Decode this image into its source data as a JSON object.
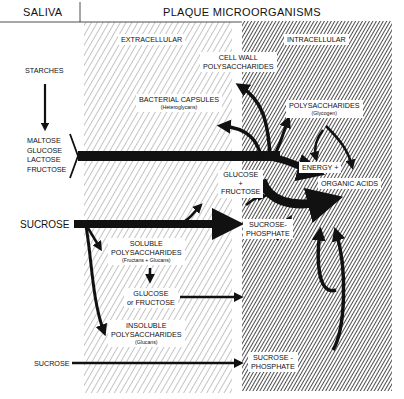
{
  "header": {
    "left_title": "SALIVA",
    "right_title": "PLAQUE MICROORGANISMS"
  },
  "regions": {
    "extracellular": "EXTRACELLULAR",
    "intracellular": "INTRACELLULAR"
  },
  "saliva": {
    "starches": "STARCHES",
    "sugars": [
      "MALTOSE",
      "GLUCOSE",
      "LACTOSE",
      "FRUCTOSE"
    ],
    "sucrose_main": "SUCROSE",
    "sucrose_lower": "SUCROSE"
  },
  "extracellular_nodes": {
    "cell_wall": [
      "CELL WALL",
      "POLYSACCHARIDES"
    ],
    "bacterial_capsules": "BACTERIAL CAPSULES",
    "bacterial_capsules_sub": "(Heteroglycans)",
    "glucose_fructose": [
      "GLUCOSE",
      "+",
      "FRUCTOSE"
    ],
    "soluble_poly": [
      "SOLUBLE",
      "POLYSACCHARIDES"
    ],
    "soluble_poly_sub": "(Fructans + Glucans)",
    "glucose_or_fructose": [
      "GLUCOSE",
      "or FRUCTOSE"
    ],
    "insoluble_poly": [
      "INSOLUBLE",
      "POLYSACCHARIDES"
    ],
    "insoluble_poly_sub": "(Glucans)"
  },
  "intracellular_nodes": {
    "polysaccharides": "POLYSACCHARIDES",
    "polysaccharides_sub": "(Glycogen)",
    "energy": "ENERGY +",
    "organic_acids": "ORGANIC ACIDS",
    "sucrose_phosphate_1": [
      "SUCROSE-",
      "PHOSPHATE"
    ],
    "sucrose_phosphate_2": [
      "SUCROSE -",
      "PHOSPHATE"
    ]
  },
  "colors": {
    "ink": "#111111",
    "background": "#ffffff"
  }
}
